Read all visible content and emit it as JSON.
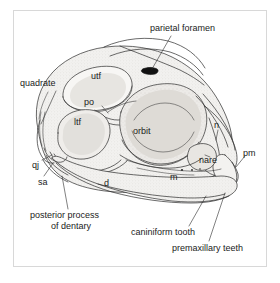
{
  "figure": {
    "frame_border_color": "#d8d8d8",
    "ink_color": "#2b2b2b",
    "fill_color": "#efeeec",
    "background": "#ffffff"
  },
  "labels": {
    "parietal_foramen": "parietal foramen",
    "quadrate": "quadrate",
    "utf": "utf",
    "po": "po",
    "ltf": "ltf",
    "orbit": "orbit",
    "n": "n",
    "pm": "pm",
    "nare": "nare",
    "qj": "qj",
    "sa": "sa",
    "d": "d",
    "m": "m",
    "posterior_process_line1": "posterior process",
    "posterior_process_line2": "of dentary",
    "caniniform_tooth": "caniniform tooth",
    "premaxillary_teeth": "premaxillary teeth"
  }
}
